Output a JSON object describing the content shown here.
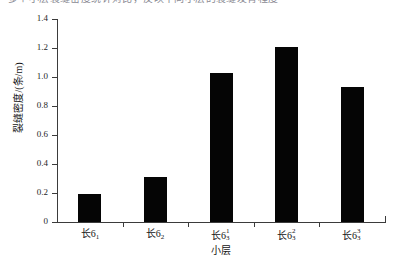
{
  "page": {
    "top_text_fragment": "多个小层裂缝密度统计对比，反映不同小层的裂缝发育程度"
  },
  "chart_data": {
    "type": "bar",
    "title": "",
    "categories": [
      "长6₁",
      "长6₂",
      "长6₃¹",
      "长6₃²",
      "长6₃³"
    ],
    "category_parts": [
      {
        "base": "长6",
        "sub": "1",
        "sup": ""
      },
      {
        "base": "长6",
        "sub": "2",
        "sup": ""
      },
      {
        "base": "长6",
        "sub": "3",
        "sup": "1"
      },
      {
        "base": "长6",
        "sub": "3",
        "sup": "2"
      },
      {
        "base": "长6",
        "sub": "3",
        "sup": "3"
      }
    ],
    "values": [
      0.19,
      0.31,
      1.03,
      1.21,
      0.93
    ],
    "xlabel": "小层",
    "ylabel": "裂缝密度/(条/m)",
    "ylim": [
      0,
      1.4
    ],
    "ytick_labels": [
      "1.4",
      "1.2",
      "1.0",
      "0.8",
      "0.6",
      "0.4",
      "0.2",
      "0"
    ],
    "ytick_values": [
      1.4,
      1.2,
      1.0,
      0.8,
      0.6,
      0.4,
      0.2,
      0
    ],
    "grid": false,
    "legend": "none",
    "bar_color": "#050505",
    "axis_color": "#3b3b3b"
  }
}
